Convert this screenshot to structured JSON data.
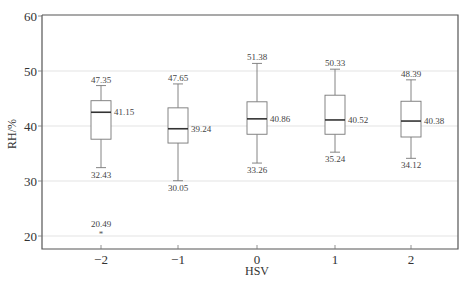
{
  "chart_data": {
    "type": "box",
    "title": "",
    "xlabel": "HSV",
    "ylabel": "RH/%",
    "ylim": [
      18,
      60
    ],
    "yticks": [
      20,
      30,
      40,
      50,
      60
    ],
    "grid": {
      "y": true,
      "x": false
    },
    "legend": null,
    "categories": [
      "−2",
      "−1",
      "0",
      "1",
      "2"
    ],
    "series": [
      {
        "category": "−2",
        "whisker_high": 47.35,
        "q3": 44.6,
        "median": 42.5,
        "q1": 37.6,
        "whisker_low": 32.43,
        "annotated_center": 41.15,
        "outliers": [
          20.49
        ]
      },
      {
        "category": "−1",
        "whisker_high": 47.65,
        "q3": 43.3,
        "median": 39.5,
        "q1": 36.9,
        "whisker_low": 30.05,
        "annotated_center": 39.24,
        "outliers": []
      },
      {
        "category": "0",
        "whisker_high": 51.38,
        "q3": 44.4,
        "median": 41.3,
        "q1": 38.5,
        "whisker_low": 33.26,
        "annotated_center": 40.86,
        "outliers": []
      },
      {
        "category": "1",
        "whisker_high": 50.33,
        "q3": 45.6,
        "median": 41.1,
        "q1": 38.5,
        "whisker_low": 35.24,
        "annotated_center": 40.52,
        "outliers": []
      },
      {
        "category": "2",
        "whisker_high": 48.39,
        "q3": 44.5,
        "median": 40.9,
        "q1": 38.0,
        "whisker_low": 34.12,
        "annotated_center": 40.38,
        "outliers": []
      }
    ],
    "annotations": [
      "47.35",
      "41.15",
      "32.43",
      "20.49",
      "47.65",
      "39.24",
      "30.05",
      "51.38",
      "40.86",
      "33.26",
      "50.33",
      "40.52",
      "35.24",
      "48.39",
      "40.38",
      "34.12"
    ],
    "outlier_marker": "*"
  }
}
